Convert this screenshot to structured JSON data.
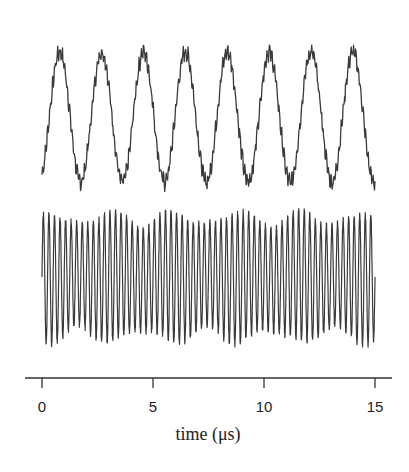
{
  "chart_data": {
    "type": "line",
    "title": "",
    "xlabel": "time (μs)",
    "ylabel": "",
    "xlim": [
      0,
      15
    ],
    "x_ticks": [
      0,
      5,
      10,
      15
    ],
    "x_tick_labels": [
      "0",
      "5",
      "10",
      "15"
    ],
    "grid": false,
    "legend": null,
    "series": [
      {
        "name": "upper trace",
        "description": "low-frequency noisy sinusoid, about 8 cycles over 15 μs (period ≈ 1.9 μs)",
        "frequency_cycles_per_us": 0.53,
        "peak_times_us": [
          0.8,
          2.7,
          4.6,
          6.4,
          8.3,
          10.1,
          12.0,
          13.9
        ],
        "amplitude_relative": 1.0,
        "noise": "high-frequency ripple on the waveform",
        "color": "#333333"
      },
      {
        "name": "lower trace",
        "description": "high-frequency oscillation, about 4 cycles per μs, with slowly varying amplitude",
        "frequency_cycles_per_us": 4.0,
        "cycles_total": 60,
        "amplitude_relative": 1.0,
        "color": "#333333"
      }
    ]
  },
  "axis": {
    "tick_labels": [
      "0",
      "5",
      "10",
      "15"
    ],
    "title": "time (μs)"
  }
}
